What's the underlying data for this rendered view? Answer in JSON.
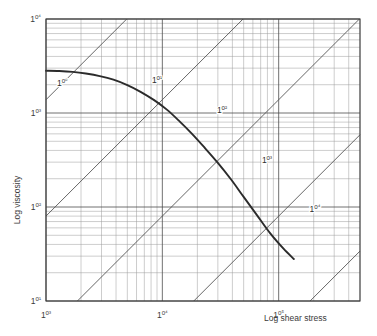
{
  "chart_data": {
    "type": "line",
    "title": "",
    "xlabel": "Log shear stress",
    "ylabel": "Log viscosity",
    "xscale": "log",
    "yscale": "log",
    "xlim": [
      1000,
      500000
    ],
    "ylim": [
      10,
      10000
    ],
    "grid": true,
    "grid_minor": true,
    "legend": "none",
    "xticks": [
      1000,
      10000,
      100000
    ],
    "xticklabels": [
      "10³",
      "10⁴",
      "10⁵"
    ],
    "yticks": [
      10,
      100,
      1000,
      10000
    ],
    "yticklabels": [
      "10¹",
      "10²",
      "10³",
      "10⁴"
    ],
    "series": [
      {
        "name": "viscosity curve",
        "comment": "flow curve: viscosity vs shear stress",
        "points": [
          [
            1000,
            2820
          ],
          [
            1300,
            2800
          ],
          [
            1700,
            2740
          ],
          [
            2200,
            2630
          ],
          [
            2900,
            2470
          ],
          [
            3800,
            2260
          ],
          [
            5000,
            1980
          ],
          [
            6500,
            1680
          ],
          [
            8500,
            1370
          ],
          [
            11000,
            1080
          ],
          [
            14000,
            820
          ],
          [
            18000,
            600
          ],
          [
            23000,
            430
          ],
          [
            30000,
            295
          ],
          [
            39000,
            196
          ],
          [
            50000,
            128
          ],
          [
            65000,
            82
          ],
          [
            85000,
            52
          ],
          [
            110000,
            36
          ],
          [
            135000,
            28
          ]
        ]
      }
    ],
    "diagonals": {
      "comment": "constant shear-rate lines, slope -1 in log viscosity vs log shear stress on these axes rendered at +45deg; labelled by decade",
      "labels": [
        "10⁰",
        "10¹",
        "10²",
        "10³",
        "10⁴"
      ],
      "label_positions": [
        {
          "label": "10⁰",
          "x": 62,
          "y": 86
        },
        {
          "label": "10¹",
          "x": 157,
          "y": 83
        },
        {
          "label": "10²",
          "x": 222,
          "y": 113
        },
        {
          "label": "10³",
          "x": 267,
          "y": 163
        },
        {
          "label": "10⁴",
          "x": 315,
          "y": 212
        }
      ]
    }
  },
  "axes": {
    "x_title": "Log shear stress",
    "y_title": "Log viscosity"
  }
}
